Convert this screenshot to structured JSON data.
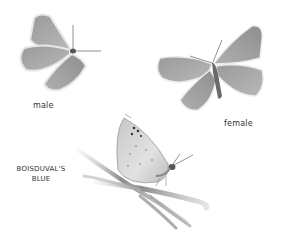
{
  "illustration": {
    "title": "Boisduval's Blue butterfly illustration",
    "labels": {
      "male": "male",
      "female": "female",
      "species_line1": "BOISDUVAL'S",
      "species_line2": "BLUE"
    },
    "figures": [
      {
        "name": "male",
        "view": "dorsal, wings open"
      },
      {
        "name": "female",
        "view": "dorsal, wings open"
      },
      {
        "name": "perched",
        "view": "lateral, wings closed on grass stems"
      }
    ],
    "colors": {
      "background": "#ffffff",
      "wing_dark": "#8a8a8a",
      "wing_mid": "#a8a8a8",
      "wing_light": "#d8d8d8",
      "outline": "#e6e6e6",
      "body": "#555555",
      "grass": "#9a9a9a",
      "label_text": "#333333"
    }
  }
}
